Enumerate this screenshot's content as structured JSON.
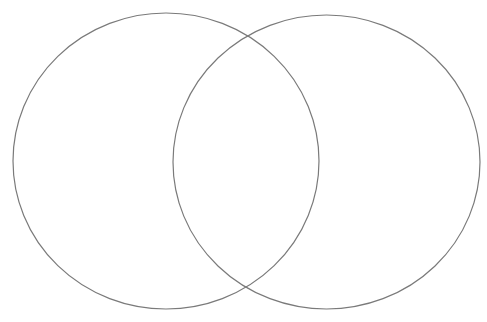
{
  "diagram": {
    "type": "venn",
    "sets": [
      {
        "id": "left",
        "label": "",
        "cx": 166,
        "cy": 161,
        "rx": 153,
        "ry": 148
      },
      {
        "id": "right",
        "label": "",
        "cx": 326.5,
        "cy": 162,
        "rx": 153.5,
        "ry": 147
      }
    ],
    "stroke_color": "#7a7a7a",
    "background": "#ffffff"
  }
}
